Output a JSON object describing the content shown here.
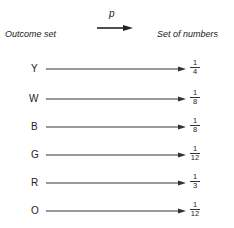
{
  "header": {
    "left_label": "Outcome set",
    "arrow_label": "p",
    "right_label": "Set of numbers"
  },
  "mapping": [
    {
      "outcome": "Y",
      "num": "1",
      "den": "4"
    },
    {
      "outcome": "W",
      "num": "1",
      "den": "8"
    },
    {
      "outcome": "B",
      "num": "1",
      "den": "8"
    },
    {
      "outcome": "G",
      "num": "1",
      "den": "12"
    },
    {
      "outcome": "R",
      "num": "1",
      "den": "3"
    },
    {
      "outcome": "O",
      "num": "1",
      "den": "12"
    }
  ]
}
